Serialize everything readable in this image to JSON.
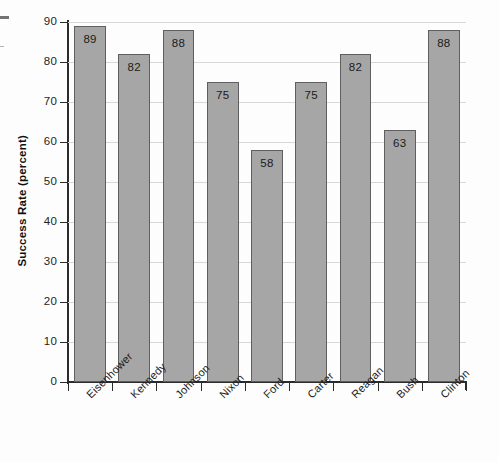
{
  "chart_data": {
    "type": "bar",
    "title": "",
    "xlabel": "",
    "ylabel": "Success Rate (percent)",
    "categories": [
      "Eisenhower",
      "Kennedy",
      "Johnson",
      "Nixon",
      "Ford",
      "Carter",
      "Reagan",
      "Bush",
      "Clinton"
    ],
    "values": [
      89,
      82,
      88,
      75,
      58,
      75,
      82,
      63,
      88
    ],
    "ylim": [
      0,
      90
    ],
    "yticks": [
      0,
      10,
      20,
      30,
      40,
      50,
      60,
      70,
      80,
      90
    ],
    "ytick_labels": [
      "0",
      "10",
      "20",
      "30",
      "40",
      "50",
      "60",
      "70",
      "80",
      "90"
    ],
    "grid": true,
    "legend": "none",
    "bar_labels_inside": true,
    "colors": {
      "bar_fill": "#a6a6a6",
      "bar_border": "#5f5f5f",
      "axis": "#2b2b2b",
      "gridline": "#d8d8d8",
      "text": "#1b1b1b",
      "background": "#fdfdfd"
    }
  }
}
